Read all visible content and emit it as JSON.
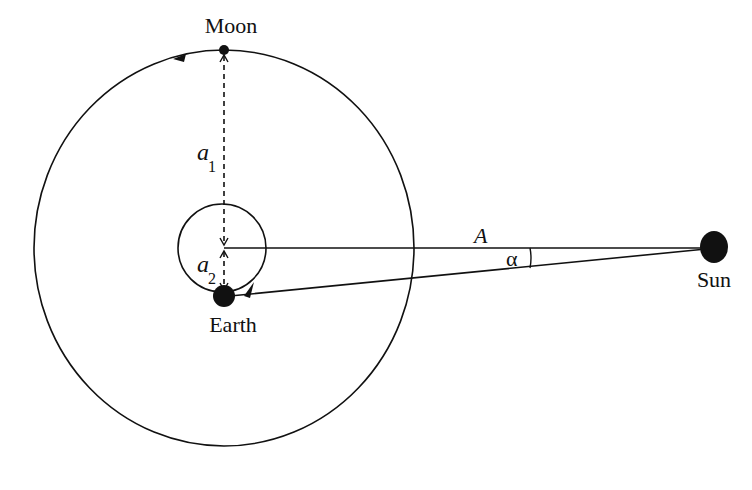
{
  "diagram": {
    "type": "orbital geometry",
    "labels": {
      "moon": "Moon",
      "earth": "Earth",
      "sun": "Sun",
      "a1_base": "a",
      "a1_sub": "1",
      "a2_base": "a",
      "a2_sub": "2",
      "distance": "A",
      "angle": "α"
    },
    "colors": {
      "stroke": "#111111",
      "background": "#ffffff"
    }
  }
}
